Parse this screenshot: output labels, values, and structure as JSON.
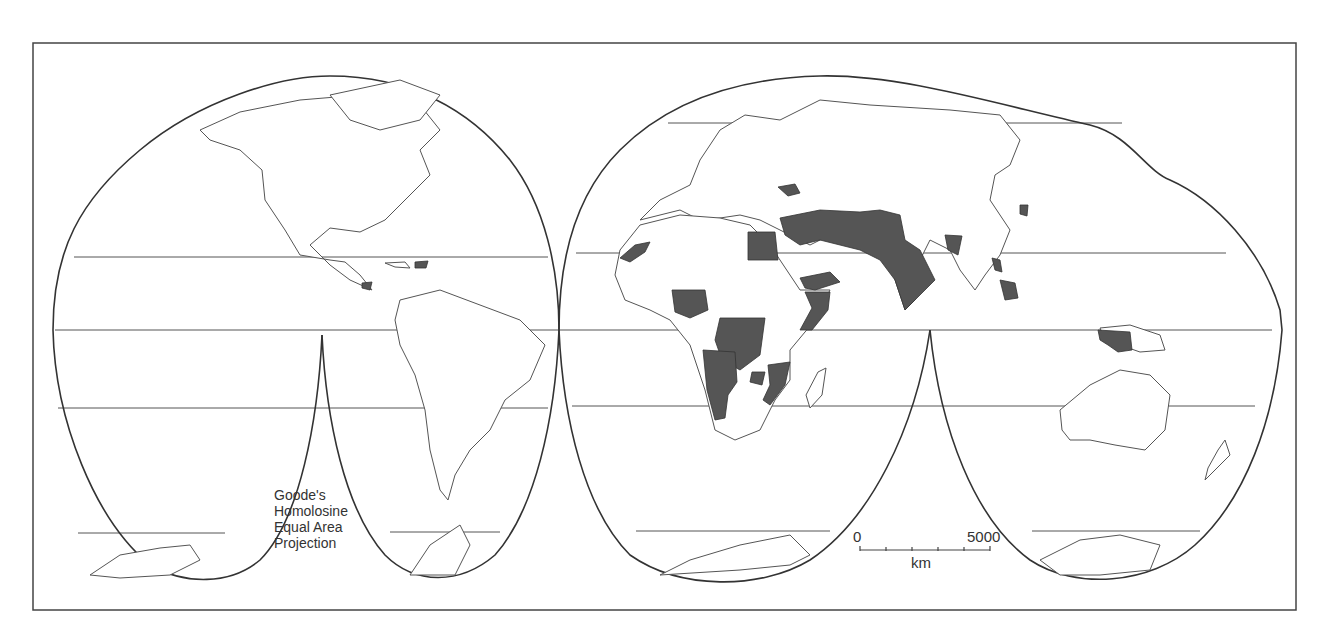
{
  "map": {
    "projection_label": [
      "Goode's",
      "Homolosine",
      "Equal Area",
      "Projection"
    ],
    "scale_bar": {
      "start": "0",
      "end": "5000",
      "unit": "km",
      "ticks": 5
    },
    "colors": {
      "frame": "#444444",
      "outline": "#333333",
      "land_fill": "#ffffff",
      "highlight_fill": "#555555",
      "graticule": "#555555"
    },
    "highlighted_regions": [
      "Bosnia and Herzegovina",
      "Western Sahara",
      "Nigeria",
      "Egypt",
      "Israel / Lebanon",
      "Syria",
      "Iraq",
      "Iran",
      "Afghanistan",
      "Pakistan",
      "India",
      "Bangladesh / Myanmar",
      "Yemen",
      "Somalia",
      "Democratic Republic of the Congo",
      "Angola",
      "Namibia",
      "Zimbabwe",
      "Mozambique",
      "Haiti",
      "Nicaragua",
      "Cambodia",
      "Laos",
      "Myanmar",
      "Papua (Indonesia)",
      "Korea"
    ]
  }
}
